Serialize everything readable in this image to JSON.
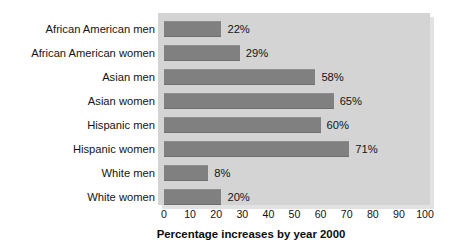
{
  "chart_data": {
    "type": "bar",
    "orientation": "horizontal",
    "title": "",
    "xlabel": "Percentage increases by year 2000",
    "ylabel": "",
    "xlim": [
      0,
      100
    ],
    "xticks": [
      0,
      10,
      20,
      30,
      40,
      50,
      60,
      70,
      80,
      90,
      100
    ],
    "xtick_labels": [
      "0",
      "10",
      "20",
      "30",
      "40",
      "50",
      "60",
      "70",
      "80",
      "90",
      "100"
    ],
    "grid": false,
    "legend": "none",
    "categories": [
      "African American men",
      "African American women",
      "Asian men",
      "Asian women",
      "Hispanic men",
      "Hispanic women",
      "White men",
      "White women"
    ],
    "values": [
      22,
      29,
      58,
      65,
      60,
      71,
      8,
      20
    ],
    "value_labels": [
      "22%",
      "29%",
      "58%",
      "65%",
      "60%",
      "71%",
      "8%",
      "20%"
    ],
    "drawn_lengths": [
      22,
      29,
      58,
      65,
      60,
      71,
      17,
      22
    ],
    "bar_color": "#808080",
    "plot_background": "#d4d4d4",
    "text_color": "#141414",
    "figure_background": "#ffffff"
  }
}
